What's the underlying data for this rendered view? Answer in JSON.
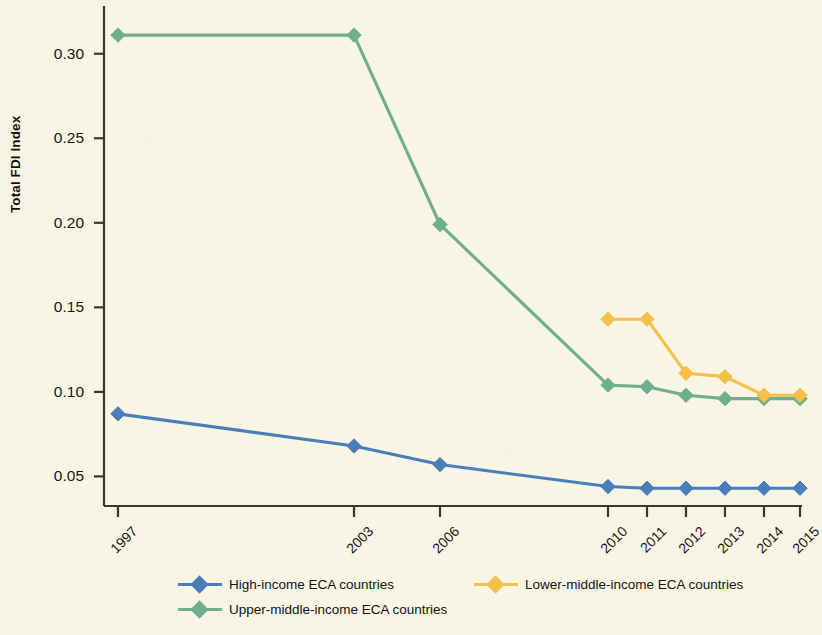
{
  "chart_data": {
    "type": "line",
    "title": "",
    "xlabel": "",
    "ylabel": "Total FDI Index",
    "categories": [
      "1997",
      "2003",
      "2006",
      "2010",
      "2011",
      "2012",
      "2013",
      "2014",
      "2015"
    ],
    "ytick_labels": [
      "0.30",
      "0.25",
      "0.20",
      "0.15",
      "0.10",
      "0.05"
    ],
    "yticks": [
      0.3,
      0.25,
      0.2,
      0.15,
      0.1,
      0.05
    ],
    "ylim": [
      0.0325,
      0.3235
    ],
    "grid": false,
    "legend_position": "bottom",
    "series": [
      {
        "name": "High-income ECA countries",
        "color": "#4a7ebb",
        "marker": "diamond",
        "values": [
          0.087,
          0.068,
          0.057,
          0.044,
          0.043,
          0.043,
          0.043,
          0.043,
          0.043
        ]
      },
      {
        "name": "Lower-middle-income ECA countries",
        "color": "#f5c04a",
        "marker": "diamond",
        "values": [
          null,
          null,
          null,
          0.143,
          0.143,
          0.111,
          0.109,
          0.098,
          0.098
        ]
      },
      {
        "name": "Upper-middle-income ECA countries",
        "color": "#6fae8e",
        "marker": "diamond",
        "values": [
          0.311,
          0.311,
          0.199,
          0.104,
          0.103,
          0.098,
          0.096,
          0.096,
          0.096
        ]
      }
    ]
  },
  "legend": {
    "entries": [
      {
        "label": "High-income ECA countries",
        "color": "#4a7ebb"
      },
      {
        "label": "Lower-middle-income ECA countries",
        "color": "#f5c04a"
      },
      {
        "label": "Upper-middle-income ECA countries",
        "color": "#6fae8e"
      }
    ]
  },
  "axes": {
    "y_title": "Total FDI Index",
    "axis_color": "#3a3630",
    "background": "#f8f5e4"
  }
}
